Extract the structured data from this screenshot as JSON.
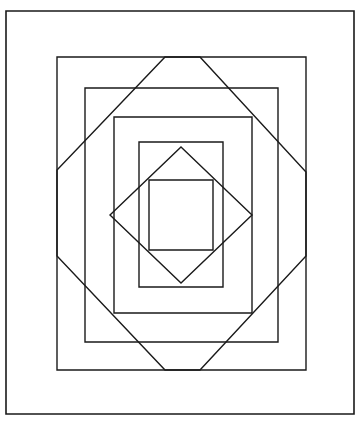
{
  "canvas": {
    "width": 361,
    "height": 425,
    "background_color": "#ffffff",
    "stroke_color": "#1a1a1a",
    "title": "Nested Rectangles and Diamonds Line Drawing"
  },
  "chart_data": {
    "type": "line",
    "xlabel": "",
    "ylabel": "",
    "grid": false,
    "legend": "none",
    "xlim": [
      0,
      361
    ],
    "ylim": [
      0,
      425
    ],
    "shapes": [
      {
        "name": "outer-border-rectangle",
        "kind": "rectangle",
        "x": 6,
        "y": 11,
        "width": 348,
        "height": 403,
        "stroke_width": 1.6
      },
      {
        "name": "rectangle-2",
        "kind": "rectangle",
        "x": 57,
        "y": 57,
        "width": 249,
        "height": 313,
        "stroke_width": 1.4
      },
      {
        "name": "rectangle-3",
        "kind": "rectangle",
        "x": 85,
        "y": 88,
        "width": 193,
        "height": 254,
        "stroke_width": 1.4
      },
      {
        "name": "rectangle-4",
        "kind": "rectangle",
        "x": 114,
        "y": 117,
        "width": 138,
        "height": 196,
        "stroke_width": 1.4
      },
      {
        "name": "rectangle-5",
        "kind": "rectangle",
        "x": 139,
        "y": 142,
        "width": 84,
        "height": 145,
        "stroke_width": 1.4
      },
      {
        "name": "rectangle-6-innermost",
        "kind": "rectangle",
        "x": 149,
        "y": 180,
        "width": 64,
        "height": 70,
        "stroke_width": 1.4
      },
      {
        "name": "outer-diamond-octagon",
        "kind": "polygon",
        "points": [
          [
            165,
            57
          ],
          [
            200,
            57
          ],
          [
            306,
            172
          ],
          [
            306,
            256
          ],
          [
            200,
            370
          ],
          [
            165,
            370
          ],
          [
            57,
            256
          ],
          [
            57,
            170
          ]
        ],
        "stroke_width": 1.4
      },
      {
        "name": "inner-diamond",
        "kind": "polygon",
        "points": [
          [
            181,
            147
          ],
          [
            252,
            215
          ],
          [
            181,
            283
          ],
          [
            110,
            215
          ]
        ],
        "stroke_width": 1.4
      }
    ]
  }
}
